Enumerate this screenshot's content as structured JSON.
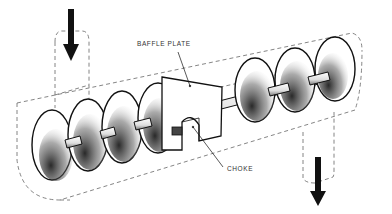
{
  "diagram": {
    "type": "technical illustration",
    "labels": {
      "baffle_plate": "BAFFLE PLATE",
      "choke": "CHOKE"
    },
    "arrows": [
      {
        "name": "inlet-arrow",
        "direction": "down",
        "position": "top-left"
      },
      {
        "name": "outlet-arrow",
        "direction": "down",
        "position": "bottom-right"
      }
    ],
    "colors": {
      "ink": "#111111",
      "dash": "#666666",
      "background": "#ffffff"
    }
  }
}
